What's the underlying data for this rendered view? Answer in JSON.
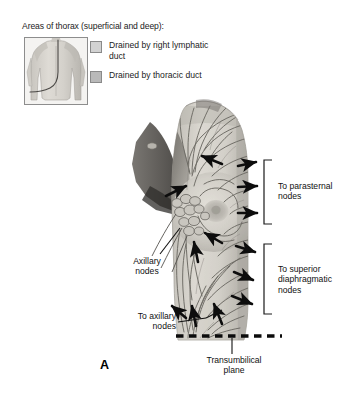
{
  "figure": {
    "letter": "A",
    "type": "anatomical-illustration"
  },
  "legend": {
    "title": "Areas of thorax (superficial and deep):",
    "items": [
      {
        "label": "Drained by right\nlymphatic duct",
        "swatch_color": "#d2d2d2",
        "swatch_style": "light"
      },
      {
        "label": "Drained by\nthoracic duct",
        "swatch_color": "#b9b9b9",
        "swatch_style": "dark"
      }
    ],
    "inset": {
      "name": "posterior-torso-inset",
      "description": "Posterior view of torso with drainage boundary line"
    }
  },
  "annotations": {
    "parasternal": "To parasternal\nnodes",
    "diaphragmatic": "To superior\ndiaphragmatic\nnodes",
    "axillary_nodes": "Axillary\nnodes",
    "to_axillary": "To axillary\nnodes",
    "transumbilical": "Transumbilical\nplane"
  },
  "colors": {
    "background": "#ffffff",
    "skin_light": "#d8d5cf",
    "skin_mid": "#c2bfb8",
    "skin_shadow": "#8f8c86",
    "vessel": "#6a6761",
    "arrow": "#0d0d0d",
    "text": "#111111",
    "bracket": "#1a1a1a"
  }
}
